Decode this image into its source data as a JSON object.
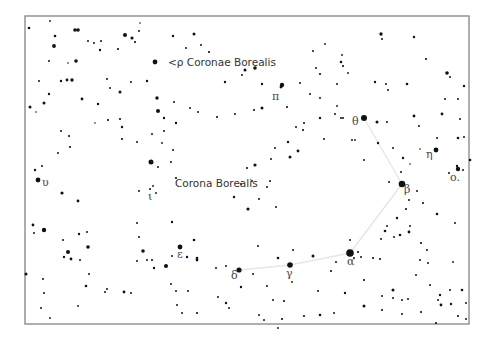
{
  "chart_title": "Corona Borealis",
  "colors": {
    "background": "#ffffff",
    "star": "#111111",
    "frame": "#8c8c8c",
    "constellation_line": "#e6e6e6",
    "label": "#333333"
  },
  "labels": {
    "constellation": "Corona Borealis",
    "rho": "<ρ Coronae Borealis",
    "pi": "π",
    "theta": "θ",
    "eta": "η",
    "omicron": "ο.",
    "beta": "β",
    "alpha": "α",
    "gamma": "γ",
    "delta": "δ",
    "epsilon": "ε",
    "iota": "ι",
    "upsilon": "υ"
  },
  "constellation_stars": [
    {
      "name": "theta",
      "mag": 4.1
    },
    {
      "name": "beta",
      "mag": 3.7
    },
    {
      "name": "alpha",
      "mag": 2.2
    },
    {
      "name": "gamma",
      "mag": 3.8
    },
    {
      "name": "delta",
      "mag": 4.6
    }
  ],
  "constellation_lines": [
    [
      "theta",
      "beta"
    ],
    [
      "beta",
      "alpha"
    ],
    [
      "alpha",
      "gamma"
    ],
    [
      "gamma",
      "delta"
    ]
  ],
  "field_star_count": "approx. 300"
}
